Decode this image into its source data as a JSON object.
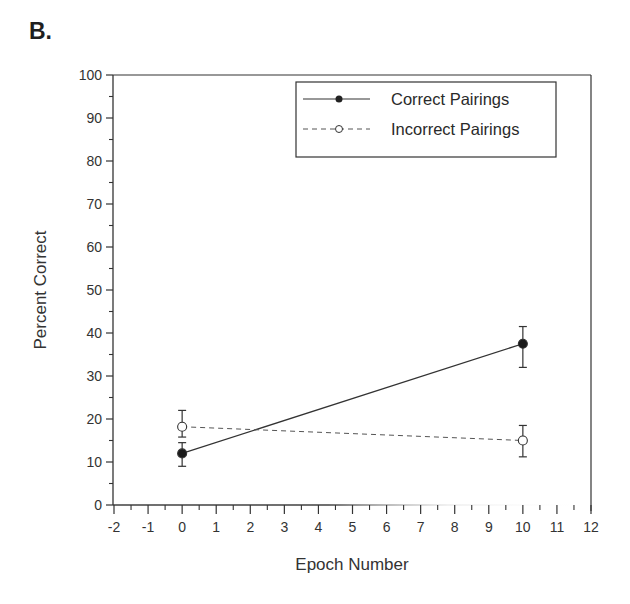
{
  "panel": {
    "label": "B."
  },
  "chart_data": {
    "type": "line",
    "title": "",
    "xlabel": "Epoch Number",
    "ylabel": "Percent Correct",
    "xlim": [
      -2,
      12
    ],
    "ylim": [
      0,
      100
    ],
    "x_ticks": [
      "-2",
      "-1",
      "0",
      "1",
      "2",
      "3",
      "4",
      "5",
      "6",
      "7",
      "8",
      "9",
      "10",
      "11",
      "12"
    ],
    "y_ticks": [
      "0",
      "10",
      "20",
      "30",
      "40",
      "50",
      "60",
      "70",
      "80",
      "90",
      "100"
    ],
    "grid": false,
    "legend_position": "upper right",
    "x": [
      0,
      10
    ],
    "series": [
      {
        "name": "Correct Pairings",
        "marker": "filled-circle",
        "line_style": "solid",
        "values": [
          12,
          37.5
        ],
        "error_low": [
          9,
          32
        ],
        "error_high": [
          14.5,
          41.5
        ]
      },
      {
        "name": "Incorrect Pairings",
        "marker": "open-circle",
        "line_style": "dashed",
        "values": [
          18.2,
          15
        ],
        "error_low": [
          15.8,
          11.2
        ],
        "error_high": [
          22,
          18.5
        ]
      }
    ]
  },
  "legend": {
    "items": [
      {
        "label": "Correct Pairings"
      },
      {
        "label": "Incorrect Pairings"
      }
    ]
  }
}
